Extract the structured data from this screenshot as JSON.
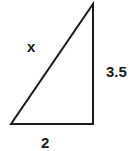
{
  "diagram": {
    "type": "right-triangle",
    "labels": {
      "hypotenuse": "x",
      "vertical_leg": "3.5",
      "horizontal_leg": "2"
    },
    "vertices": {
      "bottom_left": [
        11,
        124
      ],
      "bottom_right": [
        93,
        124
      ],
      "top": [
        93,
        4
      ]
    },
    "stroke_color": "#1a1a1a"
  }
}
